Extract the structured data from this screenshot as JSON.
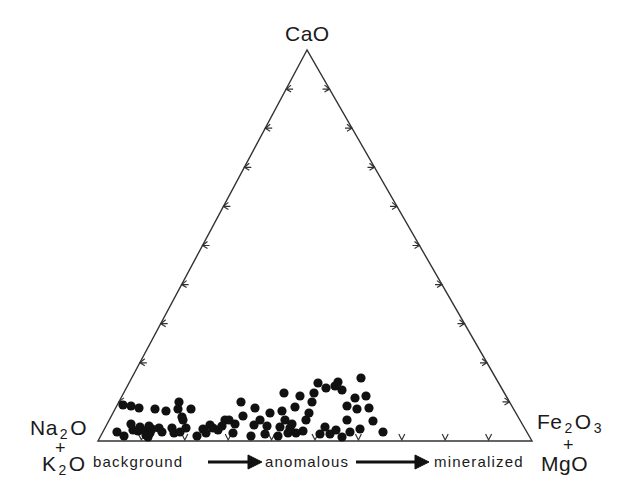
{
  "diagram": {
    "type": "ternary",
    "vertices": {
      "top": {
        "main": "CaO"
      },
      "left": {
        "line1_pre": "Na",
        "line1_sub": "2",
        "line1_post": "O",
        "plus": "+",
        "line2_pre": "K",
        "line2_sub": "2",
        "line2_post": "O"
      },
      "right": {
        "line1_pre": "Fe",
        "line1_sub": "2",
        "line1_post": "O",
        "line1_sub2": "3",
        "plus": "+",
        "line2": "MgO"
      }
    },
    "stages": [
      "background",
      "anomalous",
      "mineralized"
    ],
    "colors": {
      "line": "#333333",
      "dot": "#111111",
      "background": "#ffffff"
    }
  },
  "chart_data": {
    "type": "scatter",
    "subtype": "ternary",
    "title": "",
    "axes": [
      "CaO",
      "Na2O + K2O",
      "Fe2O3 + MgO"
    ],
    "apex_labels": {
      "top": "CaO",
      "bottom_left": "Na2O + K2O",
      "bottom_right": "Fe2O3 + MgO"
    },
    "tick_interval_percent": 10,
    "annotations": [
      "background",
      "anomalous",
      "mineralized"
    ],
    "annotation_note": "arrows indicate trend from background → anomalous → mineralized along the Fe2O3+MgO direction",
    "points_px": [
      [
        123,
        405
      ],
      [
        131,
        406
      ],
      [
        139,
        408
      ],
      [
        155,
        409
      ],
      [
        117,
        432
      ],
      [
        124,
        436
      ],
      [
        131,
        424
      ],
      [
        133,
        430
      ],
      [
        138,
        431
      ],
      [
        140,
        427
      ],
      [
        145,
        431
      ],
      [
        146,
        435
      ],
      [
        148,
        437
      ],
      [
        150,
        433
      ],
      [
        152,
        429
      ],
      [
        149,
        426
      ],
      [
        159,
        428
      ],
      [
        162,
        432
      ],
      [
        166,
        411
      ],
      [
        179,
        402
      ],
      [
        178,
        409
      ],
      [
        182,
        417
      ],
      [
        183,
        420
      ],
      [
        172,
        428
      ],
      [
        174,
        433
      ],
      [
        180,
        432
      ],
      [
        191,
        409
      ],
      [
        186,
        428
      ],
      [
        197,
        436
      ],
      [
        203,
        429
      ],
      [
        206,
        433
      ],
      [
        210,
        425
      ],
      [
        213,
        428
      ],
      [
        218,
        430
      ],
      [
        222,
        426
      ],
      [
        225,
        420
      ],
      [
        229,
        420
      ],
      [
        233,
        433
      ],
      [
        235,
        424
      ],
      [
        241,
        402
      ],
      [
        243,
        416
      ],
      [
        254,
        425
      ],
      [
        251,
        436
      ],
      [
        255,
        408
      ],
      [
        260,
        420
      ],
      [
        267,
        426
      ],
      [
        265,
        434
      ],
      [
        270,
        413
      ],
      [
        278,
        436
      ],
      [
        280,
        427
      ],
      [
        284,
        393
      ],
      [
        282,
        411
      ],
      [
        285,
        420
      ],
      [
        288,
        433
      ],
      [
        290,
        428
      ],
      [
        292,
        424
      ],
      [
        295,
        407
      ],
      [
        300,
        396
      ],
      [
        296,
        433
      ],
      [
        303,
        431
      ],
      [
        306,
        420
      ],
      [
        309,
        413
      ],
      [
        312,
        402
      ],
      [
        314,
        393
      ],
      [
        318,
        383
      ],
      [
        326,
        388
      ],
      [
        335,
        386
      ],
      [
        338,
        382
      ],
      [
        342,
        390
      ],
      [
        361,
        378
      ],
      [
        366,
        396
      ],
      [
        347,
        420
      ],
      [
        342,
        437
      ],
      [
        336,
        430
      ],
      [
        330,
        434
      ],
      [
        320,
        434
      ],
      [
        325,
        427
      ],
      [
        350,
        432
      ],
      [
        360,
        429
      ],
      [
        369,
        408
      ],
      [
        357,
        409
      ],
      [
        373,
        421
      ],
      [
        383,
        432
      ],
      [
        355,
        398
      ],
      [
        347,
        406
      ]
    ],
    "point_count": 85,
    "xlabel": "Na2O+K2O → Fe2O3+MgO",
    "ylabel": "CaO"
  }
}
